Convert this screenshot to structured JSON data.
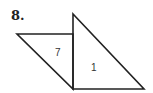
{
  "problem": {
    "number": "8."
  },
  "figure": {
    "stroke_color": "#222222",
    "left_triangle": {
      "label": "7",
      "vertices": [
        [
          17,
          34
        ],
        [
          73,
          34
        ],
        [
          73,
          89
        ]
      ]
    },
    "right_triangle": {
      "label": "1",
      "vertices": [
        [
          73,
          14
        ],
        [
          73,
          89
        ],
        [
          144,
          89
        ]
      ]
    }
  }
}
